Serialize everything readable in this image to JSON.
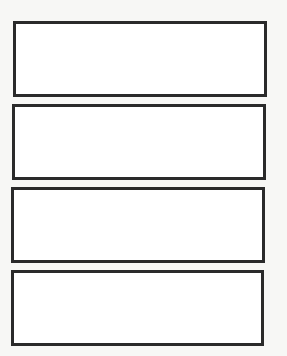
{
  "page": {
    "background": "#f7f7f5",
    "border_color": "#2a2a2a"
  },
  "boxes": [
    {
      "id": 1,
      "label": "",
      "content": ""
    },
    {
      "id": 2,
      "label": "",
      "content": ""
    },
    {
      "id": 3,
      "label": "",
      "content": ""
    },
    {
      "id": 4,
      "label": "",
      "content": ""
    }
  ]
}
